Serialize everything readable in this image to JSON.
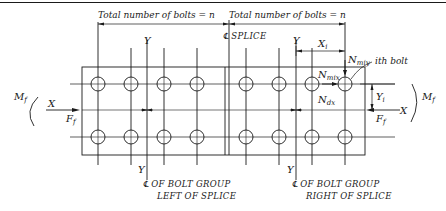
{
  "dimensions": {
    "left_group_label": "Total number of bolts = n",
    "right_group_label": "Total number of bolts = n"
  },
  "centerlines": {
    "splice_symbol": "℄",
    "splice_label": "SPLICE",
    "left_group_line1": "OF BOLT GROUP",
    "left_group_line2": "LEFT OF SPLICE",
    "right_group_line1": "OF BOLT GROUP",
    "right_group_line2": "RIGHT OF SPLICE",
    "cl_symbol": "℄"
  },
  "axes": {
    "y_label": "Y",
    "x_label": "X"
  },
  "forces": {
    "moment_left": "M",
    "moment_left_sub": "f",
    "moment_right": "M",
    "moment_right_sub": "f",
    "force_left": "F",
    "force_left_sub": "f",
    "force_right": "F",
    "force_right_sub": "f",
    "n_miy": "N",
    "n_miy_sub": "miy",
    "n_mix": "N",
    "n_mix_sub": "mix",
    "n_dx": "N",
    "n_dx_sub": "dx"
  },
  "distances": {
    "xi": "X",
    "xi_sub": "i",
    "yi": "Y",
    "yi_sub": "i"
  },
  "callouts": {
    "ith_bolt": "ith bolt"
  },
  "bolts": {
    "rows_y": [
      84,
      137
    ],
    "left_group_x": [
      98,
      131,
      164,
      197
    ],
    "right_group_x": [
      246,
      279,
      312,
      345
    ],
    "radius": 7
  },
  "colors": {
    "line": "#1a1a1a",
    "background": "#ffffff"
  }
}
